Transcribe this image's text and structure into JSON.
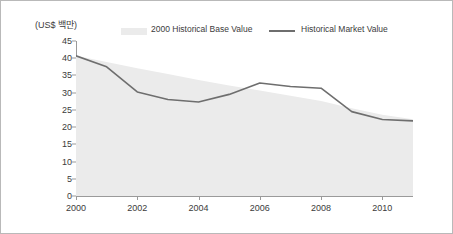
{
  "axis_unit_label": "(US$ 백만)",
  "legend": {
    "base_label": "2000 Historical Base Value",
    "line_label": "Historical Market Value",
    "base_swatch_color": "#ebebeb",
    "line_swatch_color": "#6e6e6e"
  },
  "chart_data": {
    "type": "area",
    "title": "",
    "xlabel": "",
    "ylabel": "(US$ 백만)",
    "ylim": [
      0,
      45
    ],
    "yticks": [
      45,
      40,
      35,
      30,
      25,
      20,
      15,
      10,
      5,
      0
    ],
    "xticks": [
      "2000",
      "2002",
      "2004",
      "2006",
      "2008",
      "2010"
    ],
    "x": [
      2000,
      2001,
      2002,
      2003,
      2004,
      2005,
      2006,
      2007,
      2008,
      2009,
      2010,
      2011
    ],
    "xlim": [
      2000,
      2011
    ],
    "grid": false,
    "legend_position": "top",
    "series": [
      {
        "name": "2000 Historical Base Value",
        "render": "area",
        "color": "#ebebeb",
        "values": [
          40.7,
          38.9,
          37.1,
          35.4,
          33.7,
          32.1,
          30.6,
          29.1,
          27.6,
          25.5,
          23.6,
          22.3
        ]
      },
      {
        "name": "Historical Market Value",
        "render": "line",
        "color": "#6e6e6e",
        "values": [
          40.7,
          37.5,
          30.2,
          28.0,
          27.3,
          29.5,
          32.8,
          31.8,
          31.3,
          24.5,
          22.2,
          21.8
        ]
      }
    ]
  }
}
